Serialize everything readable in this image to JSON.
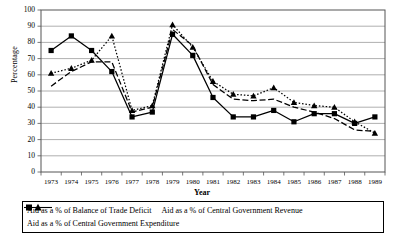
{
  "chart_data": {
    "type": "line",
    "title": "",
    "xlabel": "Year",
    "ylabel": "Percentage",
    "ylim": [
      0,
      100
    ],
    "ytick_step": 10,
    "yticks": [
      0,
      10,
      20,
      30,
      40,
      50,
      60,
      70,
      80,
      90,
      100
    ],
    "grid": true,
    "legend_position": "bottom",
    "categories": [
      1973,
      1974,
      1975,
      1976,
      1977,
      1978,
      1979,
      1980,
      1981,
      1982,
      1983,
      1984,
      1985,
      1986,
      1987,
      1988,
      1989
    ],
    "series": [
      {
        "name": "Aid as a % of Balance of Trade Deficit",
        "marker": "square",
        "line": "solid",
        "color": "#000000",
        "values": [
          75,
          84,
          75,
          62,
          34,
          37,
          85,
          72,
          46,
          34,
          34,
          38,
          31,
          36,
          36,
          30,
          34
        ]
      },
      {
        "name": "Aid as a % of Central Government Revenue",
        "marker": "triangle",
        "line": "dotted",
        "color": "#000000",
        "values": [
          61,
          64,
          69,
          84,
          38,
          41,
          91,
          77,
          56,
          48,
          47,
          52,
          43,
          41,
          40,
          31,
          24
        ]
      },
      {
        "name": "Aid as a % of Central Government Expenditure",
        "marker": "none",
        "line": "dashed",
        "color": "#000000",
        "values": [
          53,
          62,
          68,
          68,
          37,
          40,
          88,
          78,
          54,
          45,
          44,
          45,
          40,
          37,
          33,
          26,
          25
        ]
      }
    ]
  },
  "axis": {
    "ytick_labels": [
      "100",
      "90",
      "80",
      "70",
      "60",
      "50",
      "40",
      "30",
      "20",
      "10",
      "0"
    ],
    "xtick_labels": [
      "1973",
      "1974",
      "1975",
      "1976",
      "1977",
      "1978",
      "1979",
      "1980",
      "1981",
      "1982",
      "1983",
      "1984",
      "1985",
      "1986",
      "1987",
      "1988",
      "1989"
    ]
  },
  "legend": {
    "items": [
      {
        "label": "Aid as a % of Balance of Trade Deficit"
      },
      {
        "label": "Aid as a % of Central Government Revenue"
      },
      {
        "label": "Aid as a % of Central Government Expenditure"
      }
    ]
  }
}
